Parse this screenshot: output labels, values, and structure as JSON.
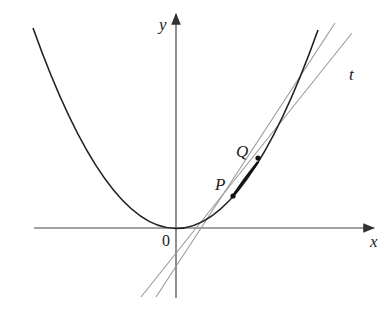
{
  "diagram": {
    "axes": {
      "x_label": "x",
      "y_label": "y",
      "origin_label": "0"
    },
    "curve": {
      "type": "parabola",
      "description": "y = x^2"
    },
    "points": [
      {
        "label": "P"
      },
      {
        "label": "Q"
      }
    ],
    "lines": [
      {
        "label": "t",
        "role": "tangent line at P"
      },
      {
        "label": "",
        "role": "secant line PQ"
      }
    ],
    "colors": {
      "curve": "#222222",
      "lines": "#888888",
      "axes": "#333333"
    }
  }
}
